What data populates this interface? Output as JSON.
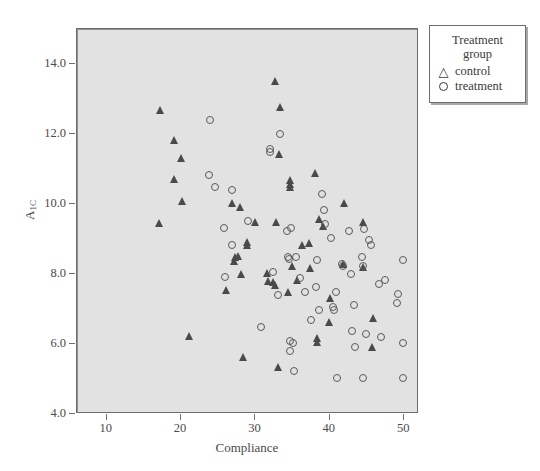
{
  "chart_data": {
    "type": "scatter",
    "title": "",
    "xlabel": "Compliance",
    "ylabel": "A1C",
    "ylabel_base": "A",
    "ylabel_sub": "1C",
    "xlim": [
      6,
      52
    ],
    "ylim": [
      4.0,
      15.0
    ],
    "xticks": [
      10,
      20,
      30,
      40,
      50
    ],
    "yticks": [
      "4.0",
      "6.0",
      "8.0",
      "10.0",
      "12.0",
      "14.0"
    ],
    "ytick_values": [
      4.0,
      6.0,
      8.0,
      10.0,
      12.0,
      14.0
    ],
    "grid": false,
    "legend_position": "outside-right-top",
    "plot_background": "#e2e2e2",
    "figure_background": "#ffffff",
    "marker_color": "#4a4a4a",
    "axis_color": "#6d6d6d",
    "series": [
      {
        "name": "control",
        "marker": "triangle",
        "points": [
          [
            17.0,
            9.45
          ],
          [
            17.2,
            12.68
          ],
          [
            19.0,
            11.82
          ],
          [
            19.1,
            10.72
          ],
          [
            20.0,
            11.32
          ],
          [
            20.1,
            10.1
          ],
          [
            21.0,
            6.22
          ],
          [
            26.8,
            10.02
          ],
          [
            27.2,
            8.48
          ],
          [
            27.1,
            8.38
          ],
          [
            27.9,
            9.92
          ],
          [
            27.6,
            8.52
          ],
          [
            28.0,
            8.0
          ],
          [
            28.3,
            5.64
          ],
          [
            26.0,
            7.54
          ],
          [
            28.9,
            8.92
          ],
          [
            28.9,
            8.82
          ],
          [
            29.9,
            9.5
          ],
          [
            31.6,
            8.02
          ],
          [
            31.7,
            7.8
          ],
          [
            32.4,
            7.76
          ],
          [
            32.6,
            7.68
          ],
          [
            32.8,
            9.5
          ],
          [
            33.0,
            5.34
          ],
          [
            33.2,
            11.44
          ],
          [
            33.3,
            12.78
          ],
          [
            32.6,
            13.52
          ],
          [
            34.4,
            7.5
          ],
          [
            34.6,
            10.7
          ],
          [
            34.6,
            10.58
          ],
          [
            34.6,
            10.5
          ],
          [
            34.9,
            8.24
          ],
          [
            35.6,
            7.82
          ],
          [
            36.3,
            8.82
          ],
          [
            37.2,
            8.9
          ],
          [
            37.4,
            8.18
          ],
          [
            38.0,
            10.9
          ],
          [
            38.3,
            6.16
          ],
          [
            38.3,
            6.06
          ],
          [
            38.6,
            9.58
          ],
          [
            39.1,
            9.36
          ],
          [
            40.0,
            7.32
          ],
          [
            39.9,
            6.62
          ],
          [
            41.9,
            10.02
          ],
          [
            41.8,
            8.28
          ],
          [
            44.4,
            9.48
          ],
          [
            44.5,
            8.2
          ],
          [
            45.8,
            6.74
          ],
          [
            45.7,
            5.92
          ]
        ]
      },
      {
        "name": "treatment",
        "marker": "circle",
        "points": [
          [
            23.9,
            12.4
          ],
          [
            23.8,
            10.82
          ],
          [
            24.6,
            10.48
          ],
          [
            25.8,
            9.32
          ],
          [
            25.9,
            7.92
          ],
          [
            26.8,
            10.4
          ],
          [
            26.9,
            8.82
          ],
          [
            29.0,
            9.52
          ],
          [
            30.8,
            6.48
          ],
          [
            32.0,
            11.58
          ],
          [
            32.0,
            11.5
          ],
          [
            32.3,
            8.06
          ],
          [
            33.0,
            7.4
          ],
          [
            33.3,
            12.0
          ],
          [
            34.3,
            9.22
          ],
          [
            34.4,
            8.5
          ],
          [
            34.5,
            8.44
          ],
          [
            34.7,
            6.1
          ],
          [
            34.6,
            5.8
          ],
          [
            34.8,
            9.32
          ],
          [
            35.1,
            6.02
          ],
          [
            35.2,
            5.24
          ],
          [
            35.4,
            8.48
          ],
          [
            36.0,
            7.9
          ],
          [
            37.5,
            6.68
          ],
          [
            38.1,
            7.62
          ],
          [
            38.3,
            8.4
          ],
          [
            38.6,
            6.98
          ],
          [
            39.0,
            10.3
          ],
          [
            39.2,
            9.82
          ],
          [
            39.4,
            9.42
          ],
          [
            40.1,
            9.02
          ],
          [
            40.4,
            7.06
          ],
          [
            40.5,
            6.96
          ],
          [
            41.0,
            5.02
          ],
          [
            41.7,
            8.3
          ],
          [
            41.8,
            8.22
          ],
          [
            42.6,
            9.22
          ],
          [
            42.9,
            8.0
          ],
          [
            43.0,
            6.38
          ],
          [
            43.3,
            7.12
          ],
          [
            43.4,
            5.92
          ],
          [
            44.3,
            8.5
          ],
          [
            44.4,
            8.22
          ],
          [
            44.6,
            9.3
          ],
          [
            45.3,
            8.98
          ],
          [
            45.6,
            8.82
          ],
          [
            44.9,
            6.3
          ],
          [
            44.4,
            5.02
          ],
          [
            46.6,
            7.72
          ],
          [
            46.9,
            6.2
          ],
          [
            47.4,
            7.82
          ],
          [
            49.2,
            7.42
          ],
          [
            49.1,
            7.16
          ],
          [
            49.9,
            8.4
          ],
          [
            49.9,
            6.04
          ],
          [
            49.9,
            5.02
          ],
          [
            36.7,
            7.48
          ],
          [
            40.9,
            7.5
          ]
        ]
      }
    ]
  },
  "legend": {
    "title_line1": "Treatment",
    "title_line2": "group",
    "entries": [
      {
        "label": "control",
        "glyph": "triangle-outline-icon"
      },
      {
        "label": "treatment",
        "glyph": "circle-outline-icon"
      }
    ]
  }
}
